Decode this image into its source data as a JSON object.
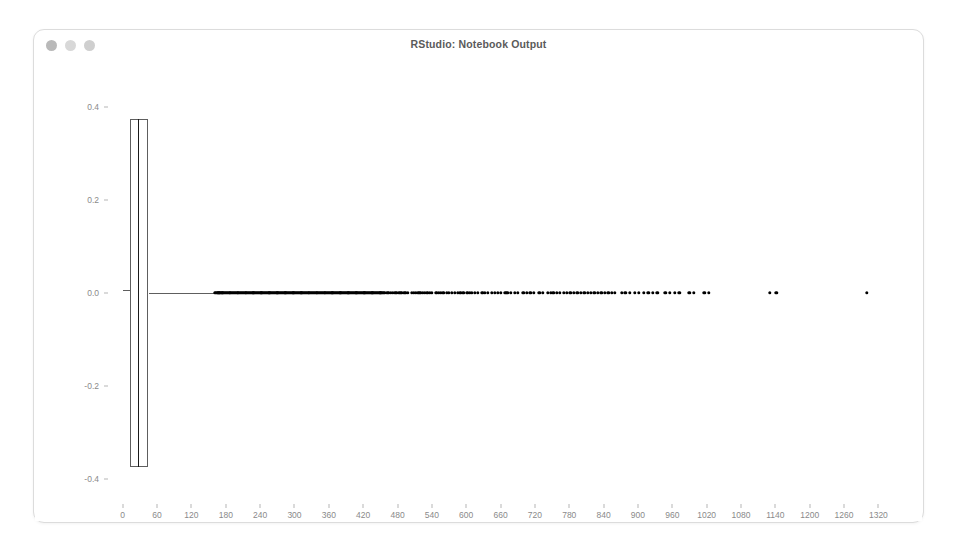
{
  "window": {
    "title": "RStudio: Notebook Output",
    "traffic_lights": [
      {
        "name": "close",
        "color": "#b9b9b9"
      },
      {
        "name": "minimize",
        "color": "#d8d8d8"
      },
      {
        "name": "maximize",
        "color": "#cfcfcf"
      }
    ]
  },
  "chart_data": {
    "type": "boxplot",
    "orientation": "horizontal",
    "title": "",
    "subtitle": "",
    "xlabel": "dep_delay",
    "ylabel": "",
    "grid": false,
    "legend": null,
    "xlim": [
      -24,
      1356
    ],
    "ylim": [
      -0.45,
      0.45
    ],
    "x_ticks": [
      0,
      60,
      120,
      180,
      240,
      300,
      360,
      420,
      480,
      540,
      600,
      660,
      720,
      780,
      840,
      900,
      960,
      1020,
      1080,
      1140,
      1200,
      1260,
      1320
    ],
    "y_ticks": [
      -0.4,
      -0.2,
      0.0,
      0.2,
      0.4
    ],
    "y_tick_labels": [
      "-0.4",
      "-0.2",
      "0.0",
      "0.2",
      "0.4"
    ],
    "box": {
      "q1": 12,
      "median": 26,
      "q3": 45,
      "whisker_low": 12,
      "whisker_high": 160,
      "box_half_height": 0.375
    },
    "outliers": [
      161,
      163,
      165,
      167,
      169,
      170,
      172,
      174,
      176,
      178,
      180,
      182,
      184,
      186,
      188,
      190,
      192,
      194,
      196,
      198,
      200,
      202,
      204,
      206,
      208,
      210,
      212,
      214,
      216,
      218,
      220,
      222,
      224,
      226,
      228,
      230,
      232,
      234,
      236,
      238,
      240,
      242,
      244,
      246,
      248,
      250,
      252,
      254,
      256,
      258,
      260,
      262,
      264,
      266,
      268,
      270,
      272,
      274,
      276,
      278,
      280,
      282,
      284,
      286,
      288,
      290,
      292,
      294,
      296,
      298,
      300,
      302,
      304,
      306,
      308,
      310,
      312,
      314,
      316,
      318,
      320,
      322,
      324,
      326,
      328,
      330,
      332,
      334,
      336,
      338,
      340,
      342,
      344,
      346,
      348,
      350,
      352,
      354,
      356,
      358,
      360,
      362,
      364,
      366,
      368,
      370,
      372,
      374,
      376,
      378,
      380,
      382,
      384,
      386,
      388,
      390,
      392,
      394,
      396,
      398,
      400,
      402,
      404,
      406,
      408,
      410,
      412,
      414,
      416,
      418,
      420,
      422,
      424,
      426,
      428,
      430,
      432,
      434,
      436,
      438,
      440,
      442,
      444,
      446,
      448,
      450,
      452,
      454,
      456,
      458,
      462,
      465,
      468,
      472,
      475,
      478,
      482,
      485,
      488,
      492,
      495,
      498,
      505,
      508,
      512,
      516,
      520,
      524,
      528,
      532,
      536,
      540,
      548,
      552,
      556,
      560,
      566,
      570,
      575,
      580,
      585,
      590,
      595,
      602,
      606,
      610,
      615,
      620,
      628,
      632,
      638,
      645,
      650,
      655,
      660,
      668,
      672,
      678,
      685,
      690,
      700,
      706,
      712,
      718,
      728,
      734,
      742,
      748,
      752,
      758,
      764,
      770,
      776,
      782,
      788,
      794,
      800,
      806,
      812,
      818,
      824,
      830,
      836,
      842,
      848,
      854,
      860,
      872,
      878,
      886,
      894,
      902,
      910,
      918,
      926,
      934,
      948,
      956,
      964,
      972,
      990,
      998,
      1016,
      1024,
      1130,
      1142,
      1300
    ]
  }
}
